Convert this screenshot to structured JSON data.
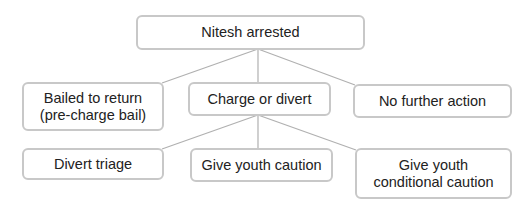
{
  "diagram": {
    "root": {
      "label": "Nitesh arrested"
    },
    "level1": [
      {
        "label": "Bailed to return (pre-charge bail)"
      },
      {
        "label": "Charge or divert"
      },
      {
        "label": "No further action"
      }
    ],
    "level2": [
      {
        "label": "Divert triage"
      },
      {
        "label": "Give youth caution"
      },
      {
        "label": "Give youth conditional caution"
      }
    ],
    "edges": [
      [
        "Nitesh arrested",
        "Bailed to return (pre-charge bail)"
      ],
      [
        "Nitesh arrested",
        "Charge or divert"
      ],
      [
        "Nitesh arrested",
        "No further action"
      ],
      [
        "Charge or divert",
        "Divert triage"
      ],
      [
        "Charge or divert",
        "Give youth caution"
      ],
      [
        "Charge or divert",
        "Give youth conditional caution"
      ]
    ],
    "colors": {
      "border": "#c8c8c8",
      "line": "#b0b0b0",
      "text": "#222222"
    }
  }
}
